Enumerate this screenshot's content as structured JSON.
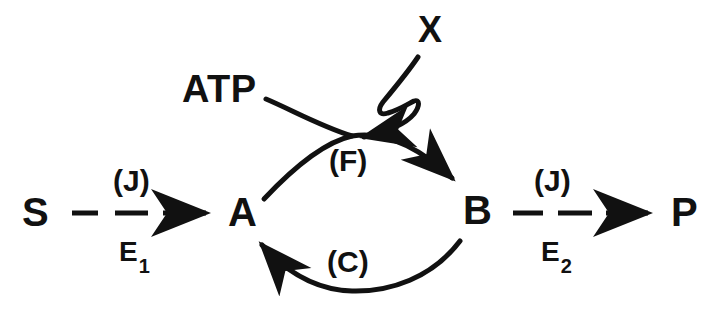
{
  "diagram": {
    "ink_color": "#111111",
    "background_color": "#ffffff",
    "nodes": {
      "substrate": "S",
      "intermediate_a": "A",
      "intermediate_b": "B",
      "product": "P",
      "cofactor": "ATP",
      "regulator": "X"
    },
    "flux_labels": {
      "left": "(J)",
      "right": "(J)"
    },
    "enzyme_labels": {
      "left_base": "E",
      "left_sub": "1",
      "right_base": "E",
      "right_sub": "2"
    },
    "cycle_labels": {
      "forward": "(F)",
      "reverse": "(C)"
    }
  }
}
